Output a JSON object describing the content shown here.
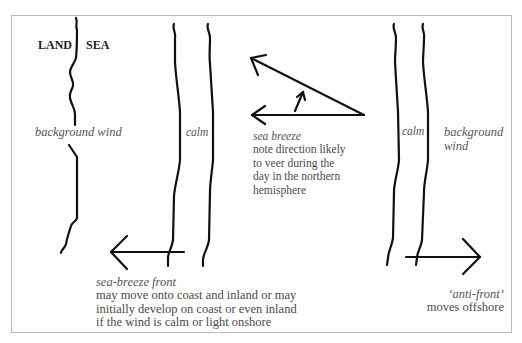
{
  "diagram": {
    "colors": {
      "ink": "#111111",
      "text": "#4a4a4a",
      "frame": "#b9b9b9"
    },
    "labels": {
      "land": "LAND",
      "sea": "SEA",
      "background_wind_left": "background wind",
      "calm_left": "calm",
      "calm_right": "calm",
      "background_wind_right_1": "background",
      "background_wind_right_2": "wind"
    },
    "sea_breeze": {
      "title": "sea breeze",
      "lines": [
        "note direction likely",
        "to veer during the",
        "day in the northern",
        "hemisphere"
      ]
    },
    "sea_breeze_front": {
      "title": "sea-breeze front",
      "lines": [
        "may move onto coast and inland or may",
        "initially develop on coast or even inland",
        "if the wind is calm or light onshore"
      ]
    },
    "anti_front": {
      "title": "‘anti-front’",
      "lines": [
        "moves offshore"
      ]
    },
    "arrows": [
      {
        "name": "sea-breeze-front-arrow",
        "direction": "left"
      },
      {
        "name": "sea-breeze-upper-arrow",
        "direction": "up-left"
      },
      {
        "name": "sea-breeze-lower-arrow",
        "direction": "left"
      },
      {
        "name": "veer-arrow",
        "direction": "up"
      },
      {
        "name": "anti-front-arrow",
        "direction": "right"
      }
    ]
  }
}
